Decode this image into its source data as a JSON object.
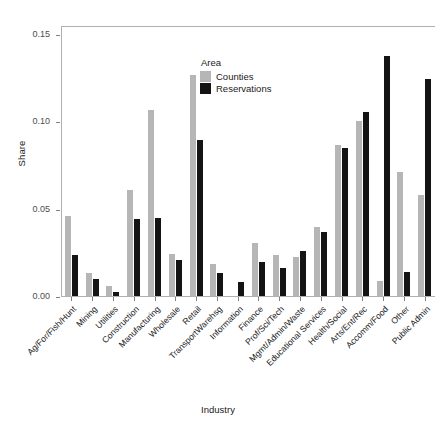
{
  "chart_data": {
    "type": "bar",
    "title": "",
    "xlabel": "Industry",
    "ylabel": "Share",
    "legend_title": "Area",
    "legend_position": "inside-top-center",
    "grid": false,
    "ylim": [
      0.0,
      0.155
    ],
    "yticks": [
      "0.00",
      "0.05",
      "0.10",
      "0.15"
    ],
    "ytick_values": [
      0.0,
      0.05,
      0.1,
      0.15
    ],
    "categories": [
      "Ag/For/Fish/Hunt",
      "Mining",
      "Utilities",
      "Construction",
      "Manufacturing",
      "Wholesale",
      "Retail",
      "TransportWarehsg",
      "Information",
      "Finance",
      "Prof/Sci/Tech",
      "Mgmt/Admin/Waste",
      "Educational Services",
      "Health/Social",
      "Arts/Ent/Rec",
      "Accomm/Food",
      "Other",
      "Public Admin"
    ],
    "series": [
      {
        "name": "Counties",
        "color": "#b6b6b6",
        "values": [
          0.046,
          0.0131,
          0.0056,
          0.0605,
          0.1065,
          0.0243,
          0.1265,
          0.0185,
          0.0,
          0.0305,
          0.0236,
          0.0224,
          0.0397,
          0.0865,
          0.1,
          0.0088,
          0.071,
          0.058
        ]
      },
      {
        "name": "Reservations",
        "color": "#141414",
        "values": [
          0.0232,
          0.0096,
          0.0023,
          0.044,
          0.0445,
          0.0208,
          0.0893,
          0.0133,
          0.008,
          0.0195,
          0.016,
          0.0258,
          0.0368,
          0.0845,
          0.1055,
          0.137,
          0.014,
          0.124
        ]
      }
    ]
  },
  "axes": {
    "y_title": "Share",
    "x_title": "Industry"
  },
  "legend": {
    "title": "Area",
    "items": [
      {
        "label": "Counties",
        "color": "#b6b6b6"
      },
      {
        "label": "Reservations",
        "color": "#141414"
      }
    ]
  }
}
